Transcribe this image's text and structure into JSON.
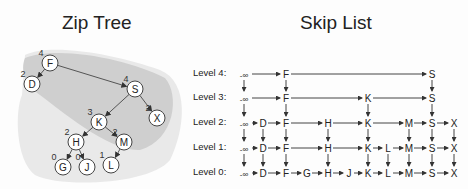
{
  "zip_tree": {
    "title": "Zip Tree",
    "nodes": [
      {
        "key": "F",
        "rank": "4",
        "x": 50,
        "y": 63
      },
      {
        "key": "D",
        "rank": "2",
        "x": 32,
        "y": 84
      },
      {
        "key": "S",
        "rank": "4",
        "x": 135,
        "y": 89
      },
      {
        "key": "X",
        "rank": "2",
        "x": 157,
        "y": 118
      },
      {
        "key": "K",
        "rank": "3",
        "x": 99,
        "y": 122
      },
      {
        "key": "H",
        "rank": "2",
        "x": 76,
        "y": 142
      },
      {
        "key": "M",
        "rank": "2",
        "x": 124,
        "y": 142
      },
      {
        "key": "G",
        "rank": "0",
        "x": 63,
        "y": 167
      },
      {
        "key": "J",
        "rank": "0",
        "x": 87,
        "y": 167
      },
      {
        "key": "L",
        "rank": "1",
        "x": 111,
        "y": 165
      }
    ],
    "edges": [
      [
        "F",
        "D"
      ],
      [
        "F",
        "S"
      ],
      [
        "S",
        "K"
      ],
      [
        "S",
        "X"
      ],
      [
        "K",
        "H"
      ],
      [
        "K",
        "M"
      ],
      [
        "H",
        "G"
      ],
      [
        "H",
        "J"
      ],
      [
        "M",
        "L"
      ]
    ]
  },
  "skip_list": {
    "title": "Skip List",
    "levels": [
      {
        "label": "Level 4:",
        "y": 74,
        "nodes": [
          "-∞",
          "F",
          "S"
        ]
      },
      {
        "label": "Level 3:",
        "y": 98,
        "nodes": [
          "-∞",
          "F",
          "K",
          "S"
        ]
      },
      {
        "label": "Level 2:",
        "y": 123,
        "nodes": [
          "-∞",
          "D",
          "F",
          "H",
          "K",
          "M",
          "S",
          "X"
        ]
      },
      {
        "label": "Level 1:",
        "y": 148,
        "nodes": [
          "-∞",
          "D",
          "F",
          "H",
          "K",
          "L",
          "M",
          "S",
          "X"
        ]
      },
      {
        "label": "Level 0:",
        "y": 173,
        "nodes": [
          "-∞",
          "D",
          "F",
          "G",
          "H",
          "J",
          "K",
          "L",
          "M",
          "S",
          "X"
        ]
      }
    ],
    "columns": {
      "-∞": 244,
      "D": 263,
      "F": 286,
      "G": 307,
      "H": 328,
      "J": 349,
      "K": 368,
      "L": 388,
      "M": 409,
      "S": 432,
      "X": 454
    }
  }
}
